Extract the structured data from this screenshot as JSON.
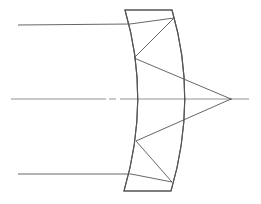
{
  "diagram": {
    "elements": [
      {
        "id": "optical-axis",
        "kind": "axis",
        "style": "dash-dot"
      },
      {
        "id": "mangin-mirror",
        "kind": "meniscus-lens-mirror"
      },
      {
        "id": "upper-ray",
        "kind": "ray"
      },
      {
        "id": "lower-ray",
        "kind": "ray"
      },
      {
        "id": "focal-point",
        "kind": "point"
      }
    ],
    "colors": {
      "line": "#555555",
      "axis": "#777777",
      "background": "#ffffff"
    }
  }
}
